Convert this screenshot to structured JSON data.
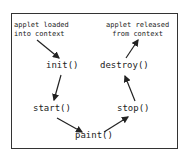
{
  "diagram": {
    "notes": {
      "loaded": [
        "applet loaded",
        "into context"
      ],
      "released": [
        "applet released",
        "from context"
      ]
    },
    "nodes": {
      "init": "init()",
      "start": "start()",
      "paint": "paint()",
      "stop": "stop()",
      "destroy": "destroy()"
    },
    "edges": [
      {
        "from": "loaded",
        "to": "init"
      },
      {
        "from": "init",
        "to": "start"
      },
      {
        "from": "start",
        "to": "paint"
      },
      {
        "from": "paint",
        "to": "stop"
      },
      {
        "from": "stop",
        "to": "destroy"
      },
      {
        "from": "destroy",
        "to": "released"
      }
    ]
  }
}
